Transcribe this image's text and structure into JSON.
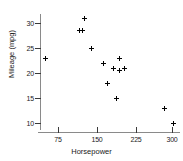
{
  "chart_data": {
    "type": "scatter",
    "title": "",
    "xlabel": "Horsepower",
    "ylabel": "Mileage (mpg)",
    "xlim": [
      40,
      315
    ],
    "ylim": [
      8,
      32.5
    ],
    "xticks": [
      75,
      150,
      225,
      300
    ],
    "yticks": [
      10,
      15,
      20,
      25,
      30
    ],
    "xtick_labels": [
      "75",
      "150",
      "225",
      "300"
    ],
    "ytick_labels": [
      "10",
      "15",
      "20",
      "25",
      "30"
    ],
    "grid": false,
    "legend": null,
    "marker": "plus",
    "marker_color": "#000000",
    "points": [
      {
        "x": 50,
        "y": 23.0
      },
      {
        "x": 117,
        "y": 28.5
      },
      {
        "x": 124,
        "y": 28.5
      },
      {
        "x": 127,
        "y": 31.0
      },
      {
        "x": 142,
        "y": 25.0
      },
      {
        "x": 165,
        "y": 22.0
      },
      {
        "x": 172,
        "y": 18.0
      },
      {
        "x": 185,
        "y": 21.0
      },
      {
        "x": 190,
        "y": 15.0
      },
      {
        "x": 196,
        "y": 20.5
      },
      {
        "x": 196,
        "y": 23.0
      },
      {
        "x": 207,
        "y": 21.0
      },
      {
        "x": 285,
        "y": 13.0
      },
      {
        "x": 302,
        "y": 10.0
      }
    ]
  },
  "axes": {
    "y_title": "Mileage (mpg)",
    "x_title": "Horsepower",
    "y_labels": [
      "30",
      "25",
      "20",
      "15",
      "10"
    ],
    "x_labels": [
      "75",
      "150",
      "225",
      "300"
    ]
  }
}
